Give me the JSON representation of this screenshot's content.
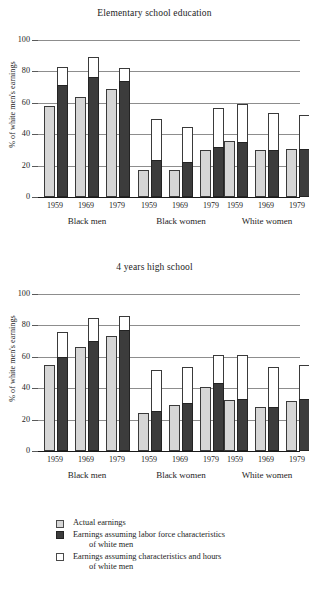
{
  "figure": {
    "ylabel": "% of white men's earnings",
    "yticks": [
      "0",
      "20",
      "40",
      "60",
      "80",
      "100"
    ],
    "groups": [
      "Black men",
      "Black women",
      "White women"
    ],
    "years": [
      "1959",
      "1969",
      "1979"
    ]
  },
  "legend": {
    "items": [
      {
        "key": "actual",
        "label": "Actual earnings",
        "continuation": "",
        "color": "#d6d6d6"
      },
      {
        "key": "labor",
        "label": "Earnings assuming labor force characteristics",
        "continuation": "of white men",
        "color": "#3c3c3c"
      },
      {
        "key": "hours",
        "label": "Earnings assuming characteristics and hours",
        "continuation": "of white men",
        "color": "#ffffff"
      }
    ]
  },
  "chart_data": [
    {
      "type": "bar",
      "title": "Elementary school education",
      "xlabel": "",
      "ylabel": "% of white men's earnings",
      "ylim": [
        0,
        100
      ],
      "grid": true,
      "legend_position": "below-figure",
      "categories": [
        "Black men 1959",
        "Black men 1969",
        "Black men 1979",
        "Black women 1959",
        "Black women 1969",
        "Black women 1979",
        "White women 1959",
        "White women 1969",
        "White women 1979"
      ],
      "series": [
        {
          "name": "Actual earnings",
          "values": [
            58,
            64,
            69,
            17.5,
            17,
            30,
            35.5,
            30,
            30.5
          ]
        },
        {
          "name": "Earnings assuming labor force characteristics of white men",
          "values": [
            71,
            76,
            74,
            23.5,
            22,
            32,
            35,
            30,
            30.5
          ]
        },
        {
          "name": "Earnings assuming characteristics and hours of white men",
          "values": [
            83,
            89,
            82,
            49.5,
            44.5,
            57,
            59.5,
            53.5,
            52.5
          ]
        }
      ]
    },
    {
      "type": "bar",
      "title": "4 years high school",
      "xlabel": "",
      "ylabel": "% of white men's earnings",
      "ylim": [
        0,
        100
      ],
      "grid": true,
      "legend_position": "below-figure",
      "categories": [
        "Black men 1959",
        "Black men 1969",
        "Black men 1979",
        "Black women 1959",
        "Black women 1969",
        "Black women 1979",
        "White women 1959",
        "White women 1969",
        "White women 1979"
      ],
      "series": [
        {
          "name": "Actual earnings",
          "values": [
            54.5,
            66,
            73.5,
            24,
            29.5,
            41,
            32.5,
            28,
            32
          ]
        },
        {
          "name": "Earnings assuming labor force characteristics of white men",
          "values": [
            60,
            70,
            77,
            25.5,
            30.5,
            43.5,
            33,
            28,
            33
          ]
        },
        {
          "name": "Earnings assuming characteristics and hours of white men",
          "values": [
            76,
            85,
            86,
            51.5,
            53.5,
            61,
            61,
            53.5,
            54.5
          ]
        }
      ]
    }
  ]
}
